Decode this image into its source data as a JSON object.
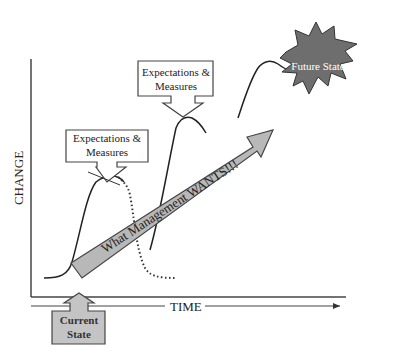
{
  "diagram": {
    "y_axis_label": "CHANGE",
    "x_axis_label": "TIME",
    "callouts": [
      {
        "line1": "Expectations &",
        "line2": "Measures"
      },
      {
        "line1": "Expectations &",
        "line2": "Measures"
      }
    ],
    "diagonal_arrow_label": "What Management WANTS!!!",
    "future_state_label": "Future State",
    "current_state": {
      "line1": "Current",
      "line2": "State"
    },
    "colors": {
      "line": "#222222",
      "arrow_fill": "#b8b8b8",
      "starburst_fill": "#6e6e6e",
      "starburst_text": "#ffffff",
      "box_fill": "#ffffff",
      "current_state_fill": "#c4c4c4"
    }
  }
}
